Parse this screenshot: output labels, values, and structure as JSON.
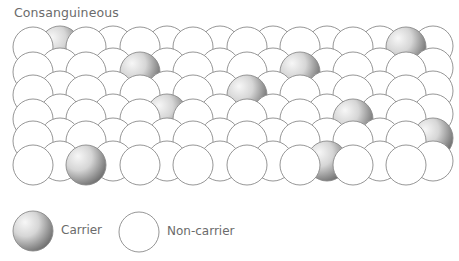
{
  "title": "Consanguineous",
  "colors": {
    "stroke": "#8a8a8a",
    "non_carrier_fill": "#ffffff",
    "carrier_light": "#f4f4f4",
    "carrier_dark": "#7a7a7a"
  },
  "grid": {
    "radius": 20,
    "front_x": [
      33,
      86,
      140,
      193,
      247,
      300,
      353,
      406
    ],
    "back_x": [
      60,
      113,
      167,
      220,
      273,
      327,
      380,
      433
    ],
    "rows": [
      {
        "front_y": 47,
        "back_y": 46,
        "carriers_front": [
          7
        ],
        "carriers_back": [
          0
        ]
      },
      {
        "front_y": 72,
        "back_y": 68,
        "carriers_front": [
          2,
          5
        ],
        "carriers_back": []
      },
      {
        "front_y": 95,
        "back_y": 91,
        "carriers_front": [
          4
        ],
        "carriers_back": []
      },
      {
        "front_y": 119,
        "back_y": 114,
        "carriers_front": [
          6
        ],
        "carriers_back": [
          2
        ]
      },
      {
        "front_y": 141,
        "back_y": 138,
        "carriers_front": [],
        "carriers_back": [
          7
        ]
      },
      {
        "front_y": 165,
        "back_y": 161,
        "carriers_front": [
          1
        ],
        "carriers_back": [
          5
        ]
      }
    ]
  },
  "legend": {
    "items": [
      {
        "label": "Carrier",
        "type": "carrier"
      },
      {
        "label": "Non-carrier",
        "type": "non-carrier"
      }
    ]
  }
}
